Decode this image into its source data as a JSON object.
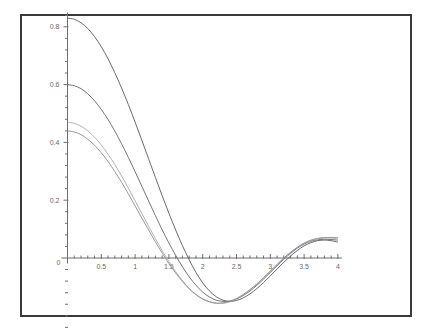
{
  "figure": {
    "background_color": "#ffffff",
    "frame_color": "#3a3a3a",
    "axis_color": "#6e6e6e",
    "label_color": "#6a6a6a"
  },
  "chart_data": {
    "type": "line",
    "title": "",
    "subtitle": "",
    "xlabel": "",
    "ylabel": "",
    "xlim": [
      0,
      4
    ],
    "ylim": [
      -0.13,
      0.87
    ],
    "grid": false,
    "legend": "none",
    "axis_style": "crossing-at-origin",
    "origin_label": "0",
    "xticks": [
      0.5,
      1,
      1.5,
      2,
      2.5,
      3,
      3.5,
      4
    ],
    "xticklabels": [
      "0.5",
      "1",
      "1.5",
      "2",
      "2.5",
      "3",
      "3.5",
      "4"
    ],
    "yticks": [
      0.2,
      0.4,
      0.6,
      0.8
    ],
    "yticklabels": [
      "0.2",
      "0.4",
      "0.6",
      "0.8"
    ],
    "minor_ticks_per_interval": 4,
    "x": [
      0,
      0.1,
      0.2,
      0.3,
      0.4,
      0.5,
      0.6,
      0.7,
      0.8,
      0.9,
      1.0,
      1.1,
      1.2,
      1.3,
      1.4,
      1.5,
      1.6,
      1.7,
      1.8,
      1.9,
      2.0,
      2.1,
      2.2,
      2.3,
      2.4,
      2.5,
      2.6,
      2.7,
      2.8,
      2.9,
      3.0,
      3.1,
      3.2,
      3.3,
      3.4,
      3.5,
      3.6,
      3.7,
      3.8,
      3.9,
      4.0
    ],
    "series": [
      {
        "name": "curve-1",
        "color": "#58585e",
        "start_value": 0.83,
        "zero_crossing": 1.95,
        "minimum": {
          "x": 2.45,
          "y": -0.105
        },
        "end_value": 0.055,
        "values": [
          0.83,
          0.826,
          0.814,
          0.794,
          0.766,
          0.731,
          0.689,
          0.641,
          0.588,
          0.531,
          0.47,
          0.407,
          0.343,
          0.279,
          0.216,
          0.155,
          0.097,
          0.043,
          -0.006,
          -0.05,
          -0.086,
          -0.114,
          -0.134,
          -0.146,
          -0.15,
          -0.147,
          -0.138,
          -0.124,
          -0.106,
          -0.085,
          -0.062,
          -0.038,
          -0.015,
          0.007,
          0.026,
          0.042,
          0.053,
          0.06,
          0.062,
          0.06,
          0.055
        ]
      },
      {
        "name": "curve-2",
        "color": "#646469",
        "start_value": 0.6,
        "zero_crossing": 1.82,
        "minimum": {
          "x": 2.38,
          "y": -0.1
        },
        "end_value": 0.062,
        "values": [
          0.6,
          0.596,
          0.586,
          0.568,
          0.544,
          0.514,
          0.479,
          0.439,
          0.395,
          0.348,
          0.299,
          0.248,
          0.197,
          0.147,
          0.098,
          0.052,
          0.009,
          -0.03,
          -0.065,
          -0.094,
          -0.118,
          -0.135,
          -0.146,
          -0.15,
          -0.149,
          -0.142,
          -0.13,
          -0.114,
          -0.095,
          -0.073,
          -0.05,
          -0.027,
          -0.004,
          0.016,
          0.034,
          0.048,
          0.058,
          0.063,
          0.065,
          0.064,
          0.062
        ]
      },
      {
        "name": "curve-3",
        "color": "#a9a9ae",
        "start_value": 0.47,
        "zero_crossing": 1.73,
        "minimum": {
          "x": 2.32,
          "y": -0.098
        },
        "end_value": 0.068,
        "values": [
          0.47,
          0.466,
          0.456,
          0.44,
          0.418,
          0.391,
          0.359,
          0.323,
          0.284,
          0.242,
          0.198,
          0.154,
          0.11,
          0.067,
          0.026,
          -0.012,
          -0.047,
          -0.078,
          -0.105,
          -0.126,
          -0.142,
          -0.152,
          -0.157,
          -0.157,
          -0.152,
          -0.142,
          -0.128,
          -0.111,
          -0.091,
          -0.069,
          -0.046,
          -0.023,
          -0.001,
          0.019,
          0.036,
          0.05,
          0.06,
          0.066,
          0.069,
          0.069,
          0.068
        ]
      },
      {
        "name": "curve-4",
        "color": "#8d8d93",
        "start_value": 0.44,
        "zero_crossing": 1.7,
        "minimum": {
          "x": 2.3,
          "y": -0.097
        },
        "end_value": 0.07,
        "values": [
          0.44,
          0.436,
          0.427,
          0.411,
          0.39,
          0.364,
          0.334,
          0.299,
          0.262,
          0.222,
          0.18,
          0.138,
          0.097,
          0.056,
          0.017,
          -0.019,
          -0.052,
          -0.081,
          -0.107,
          -0.127,
          -0.142,
          -0.151,
          -0.156,
          -0.155,
          -0.15,
          -0.14,
          -0.126,
          -0.109,
          -0.09,
          -0.068,
          -0.045,
          -0.022,
          0.0,
          0.02,
          0.037,
          0.052,
          0.062,
          0.068,
          0.071,
          0.071,
          0.07
        ]
      }
    ]
  }
}
